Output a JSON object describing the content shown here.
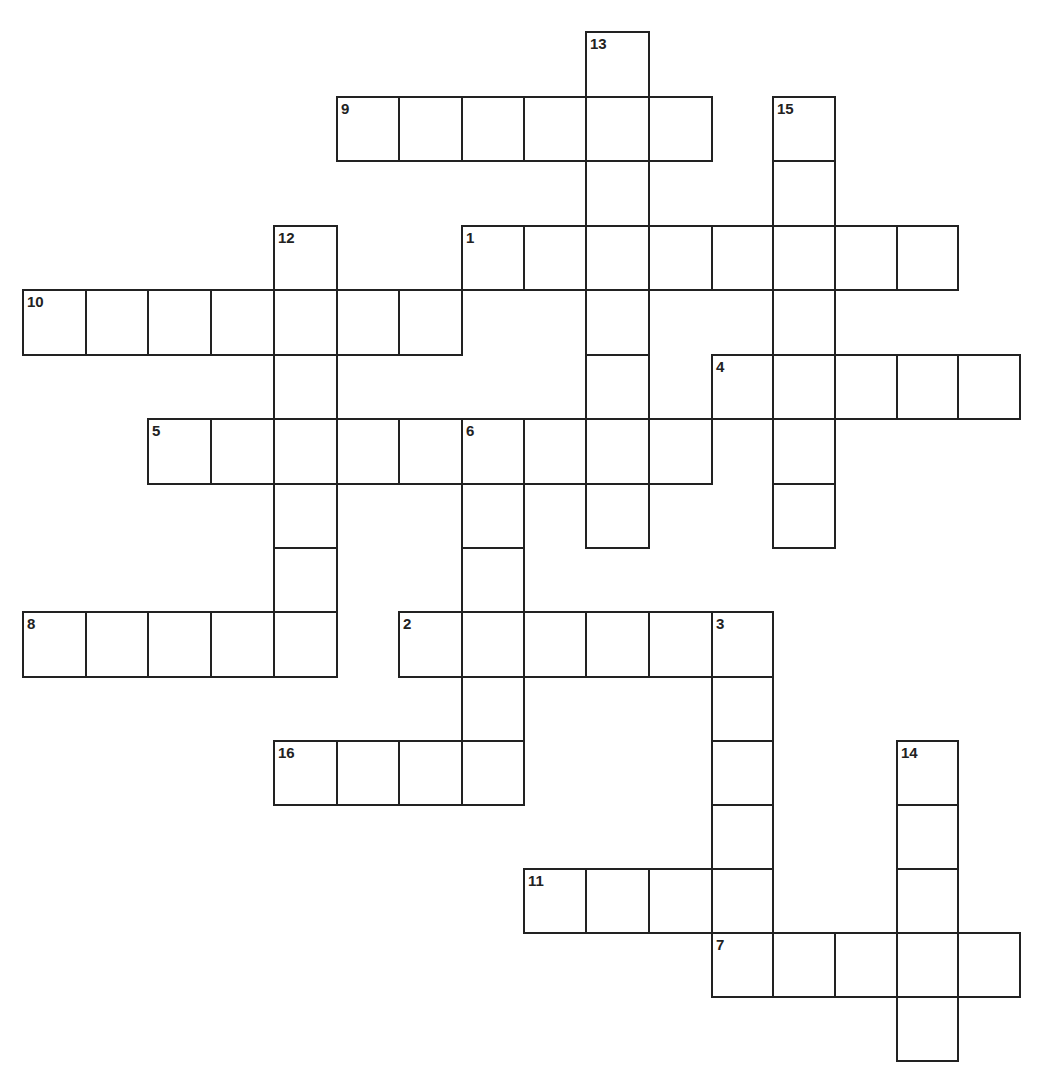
{
  "puzzle": {
    "type": "crossword",
    "grid_origin": {
      "x": 23,
      "y": 32
    },
    "col_x": [
      23,
      86,
      148,
      211,
      274,
      337,
      399,
      462,
      524,
      586,
      649,
      712,
      773,
      835,
      897,
      958,
      1020
    ],
    "row_y": [
      32,
      97,
      161,
      226,
      290,
      355,
      419,
      484,
      548,
      612,
      677,
      741,
      805,
      869,
      933,
      997,
      1061
    ],
    "colors": {
      "border": "#222222",
      "background": "#ffffff",
      "number": "#222222"
    },
    "entries": [
      {
        "number": "1",
        "direction": "across",
        "row": 3,
        "col": 7,
        "length": 8
      },
      {
        "number": "2",
        "direction": "across",
        "row": 9,
        "col": 6,
        "length": 6
      },
      {
        "number": "3",
        "direction": "down",
        "row": 9,
        "col": 11,
        "length": 5
      },
      {
        "number": "4",
        "direction": "across",
        "row": 5,
        "col": 11,
        "length": 5
      },
      {
        "number": "5",
        "direction": "across",
        "row": 6,
        "col": 2,
        "length": 9
      },
      {
        "number": "6",
        "direction": "down",
        "row": 6,
        "col": 7,
        "length": 6
      },
      {
        "number": "7",
        "direction": "across",
        "row": 14,
        "col": 11,
        "length": 5
      },
      {
        "number": "8",
        "direction": "across",
        "row": 9,
        "col": 0,
        "length": 5
      },
      {
        "number": "9",
        "direction": "across",
        "row": 1,
        "col": 5,
        "length": 6
      },
      {
        "number": "10",
        "direction": "across",
        "row": 4,
        "col": 0,
        "length": 7
      },
      {
        "number": "11",
        "direction": "across",
        "row": 13,
        "col": 8,
        "length": 4
      },
      {
        "number": "12",
        "direction": "down",
        "row": 3,
        "col": 4,
        "length": 7
      },
      {
        "number": "13",
        "direction": "down",
        "row": 0,
        "col": 9,
        "length": 8
      },
      {
        "number": "14",
        "direction": "down",
        "row": 11,
        "col": 14,
        "length": 5
      },
      {
        "number": "15",
        "direction": "down",
        "row": 1,
        "col": 12,
        "length": 7
      },
      {
        "number": "16",
        "direction": "across",
        "row": 11,
        "col": 4,
        "length": 4
      }
    ]
  }
}
